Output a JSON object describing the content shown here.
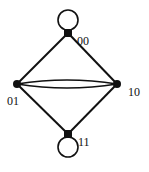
{
  "diagram": {
    "type": "graph",
    "nodes": [
      {
        "id": "00",
        "label": "00",
        "self_loop": true
      },
      {
        "id": "01",
        "label": "01",
        "self_loop": false
      },
      {
        "id": "10",
        "label": "10",
        "self_loop": false
      },
      {
        "id": "11",
        "label": "11",
        "self_loop": true
      }
    ],
    "edges": [
      {
        "from": "00",
        "to": "01"
      },
      {
        "from": "00",
        "to": "10"
      },
      {
        "from": "01",
        "to": "11"
      },
      {
        "from": "10",
        "to": "11"
      },
      {
        "from": "01",
        "to": "10",
        "multiplicity": 2
      },
      {
        "from": "00",
        "to": "00",
        "loop": true
      },
      {
        "from": "11",
        "to": "11",
        "loop": true
      }
    ],
    "colors": {
      "stroke": "#111111",
      "background": "#ffffff"
    }
  }
}
